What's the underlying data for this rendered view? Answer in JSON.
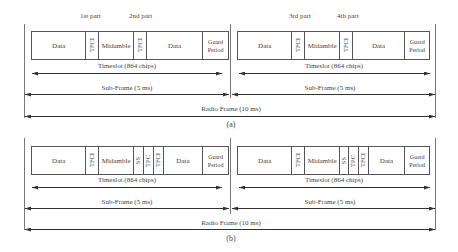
{
  "diagram": {
    "a": {
      "caption": "(a)",
      "part_labels": [
        "1st part",
        "2nd part",
        "3rd part",
        "4th part"
      ],
      "left_slot": {
        "cells": [
          {
            "label": "Data",
            "width": 55
          },
          {
            "label": "TFCI",
            "width": 13,
            "vertical": true
          },
          {
            "label": "Midamble",
            "width": 35
          },
          {
            "label": "TFCI",
            "width": 13,
            "vertical": true
          },
          {
            "label": "Data",
            "width": 57
          },
          {
            "label": "Guard Period",
            "width": 25
          }
        ]
      },
      "right_slot": {
        "cells": [
          {
            "label": "Data",
            "width": 55
          },
          {
            "label": "TFCI",
            "width": 13,
            "vertical": true
          },
          {
            "label": "Midamble",
            "width": 35
          },
          {
            "label": "TFCI",
            "width": 13,
            "vertical": true
          },
          {
            "label": "Data",
            "width": 57
          },
          {
            "label": "Guard Period",
            "width": 25
          }
        ]
      },
      "timeslot_label": "Timeslot (864 chips)",
      "subframe_label": "Sub-Frame (5 ms)",
      "radio_frame_label": "Radio Frame (10 ms)"
    },
    "b": {
      "caption": "(b)",
      "left_slot": {
        "cells": [
          {
            "label": "Data",
            "width": 55
          },
          {
            "label": "TFCI",
            "width": 13,
            "vertical": true
          },
          {
            "label": "Midamble",
            "width": 35
          },
          {
            "label": "SS",
            "width": 10,
            "vertical": true
          },
          {
            "label": "TPC",
            "width": 10,
            "vertical": true
          },
          {
            "label": "TFCI",
            "width": 10,
            "vertical": true
          },
          {
            "label": "Data",
            "width": 40
          },
          {
            "label": "Guard Period",
            "width": 25
          }
        ]
      },
      "right_slot": {
        "cells": [
          {
            "label": "Data",
            "width": 55
          },
          {
            "label": "TFCI",
            "width": 13,
            "vertical": true
          },
          {
            "label": "Midamble",
            "width": 35
          },
          {
            "label": "SS",
            "width": 10,
            "vertical": true
          },
          {
            "label": "TPC",
            "width": 10,
            "vertical": true
          },
          {
            "label": "TFCI",
            "width": 10,
            "vertical": true
          },
          {
            "label": "Data",
            "width": 40
          },
          {
            "label": "Guard Period",
            "width": 25
          }
        ]
      },
      "timeslot_label": "Timeslot (864 chips)",
      "subframe_label": "Sub-Frame (5 ms)",
      "radio_frame_label": "Radio Frame (10 ms)"
    }
  }
}
